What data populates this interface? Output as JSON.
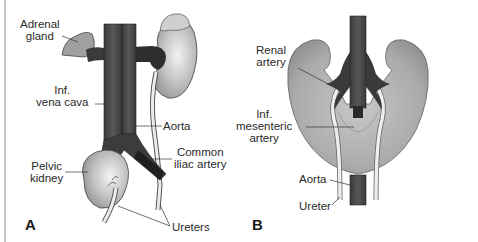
{
  "figure": {
    "panels": [
      {
        "id": "A",
        "letter": "A",
        "title": "Pelvic kidney",
        "labels": {
          "adrenal_gland": [
            "Adrenal",
            "gland"
          ],
          "inf_vena_cava": [
            "Inf.",
            "vena cava"
          ],
          "aorta": "Aorta",
          "pelvic_kidney": [
            "Pelvic",
            "kidney"
          ],
          "common_iliac_artery": [
            "Common",
            "iliac artery"
          ],
          "ureters": "Ureters"
        }
      },
      {
        "id": "B",
        "letter": "B",
        "title": "Horseshoe kidney",
        "labels": {
          "renal_artery": [
            "Renal",
            "artery"
          ],
          "inf_mesenteric_artery": [
            "Inf.",
            "mesenteric",
            "artery"
          ],
          "aorta": "Aorta",
          "ureter": "Ureter"
        }
      }
    ],
    "colors": {
      "vessel": "#4a4a4a",
      "vessel_dark": "#2e2e2e",
      "kidney": "#b9b9b9",
      "kidney_highlight": "#ececec",
      "adrenal": "#9a9a9a",
      "ureter": "#e6e6e6",
      "leader_line": "#333333",
      "text": "#2a2a2a"
    }
  }
}
